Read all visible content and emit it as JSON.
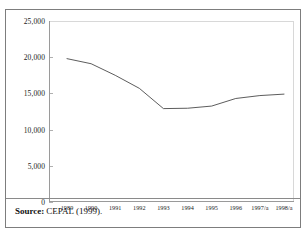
{
  "figure": {
    "clipped_title": "Chart",
    "source_label": "Source:",
    "source_text": "CEPAL (1999)."
  },
  "chart_data": {
    "type": "line",
    "title": "",
    "xlabel": "",
    "ylabel": "",
    "categories": [
      "1989",
      "1990",
      "1991",
      "1992",
      "1993",
      "1994",
      "1995",
      "1996",
      "1997/a",
      "1998/a"
    ],
    "values": [
      19800,
      19100,
      17500,
      15700,
      12900,
      12950,
      13250,
      14300,
      14700,
      14900
    ],
    "ylim": [
      0,
      25000
    ],
    "yticks": [
      0,
      5000,
      10000,
      15000,
      20000,
      25000
    ],
    "ytick_labels": [
      "0",
      "5,000",
      "10,000",
      "15,000",
      "20,000",
      "25,000"
    ],
    "grid": false,
    "legend": false,
    "series": [
      {
        "name": "series-1",
        "color": "#4a4a4a",
        "values": [
          19800,
          19100,
          17500,
          15700,
          12900,
          12950,
          13250,
          14300,
          14700,
          14900
        ]
      }
    ]
  }
}
